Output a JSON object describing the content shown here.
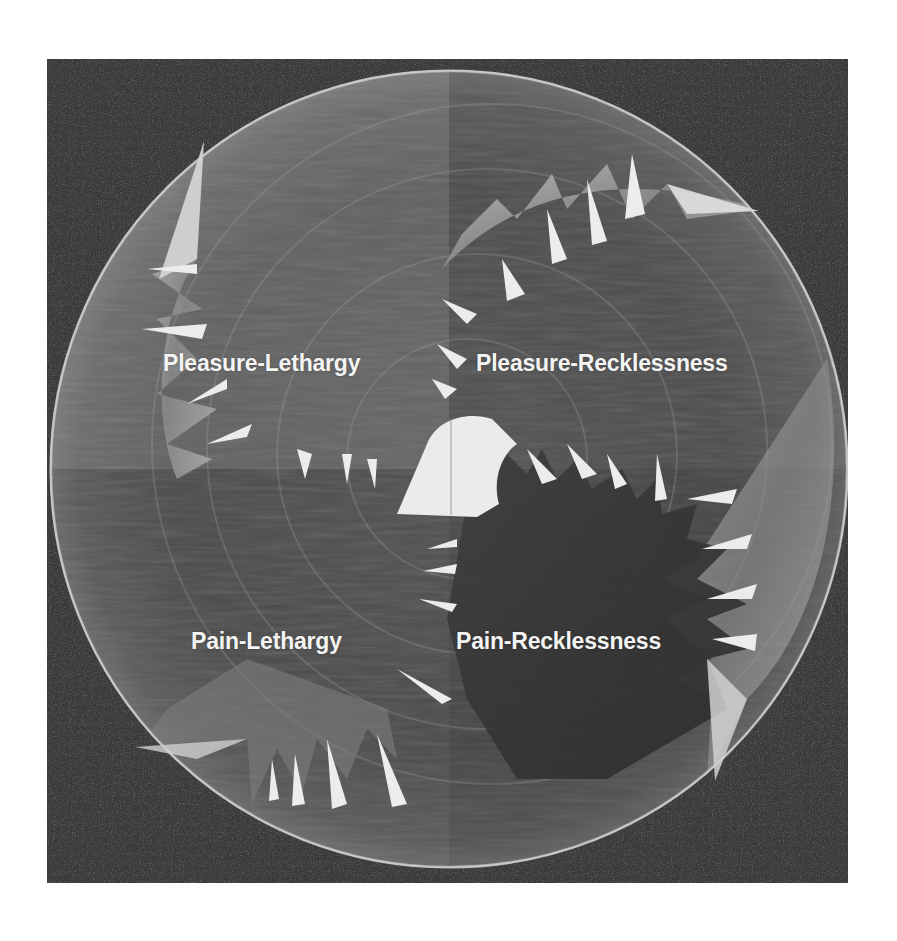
{
  "figure": {
    "colors": {
      "page_background": "#ffffff",
      "photo_background": "#3b3b3b",
      "disc_fill": "#555555",
      "highlight": "#e8e8e8",
      "label_text": "#f4f4f4"
    },
    "quadrants": [
      {
        "id": "top-left",
        "label": "Pleasure-Lethargy"
      },
      {
        "id": "top-right",
        "label": "Pleasure-Recklessness"
      },
      {
        "id": "bottom-left",
        "label": "Pain-Lethargy"
      },
      {
        "id": "bottom-right",
        "label": "Pain-Recklessness"
      }
    ]
  }
}
